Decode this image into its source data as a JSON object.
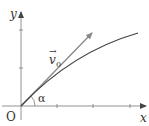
{
  "diagram": {
    "type": "projectile-trajectory",
    "labels": {
      "y_axis": "y",
      "x_axis": "x",
      "origin": "O",
      "velocity": "v",
      "velocity_subscript": "0",
      "velocity_arrow": "→",
      "angle": "α"
    },
    "colors": {
      "axes": "#555555",
      "velocity_vector": "#888888",
      "trajectory": "#444444",
      "text": "#333333"
    }
  }
}
